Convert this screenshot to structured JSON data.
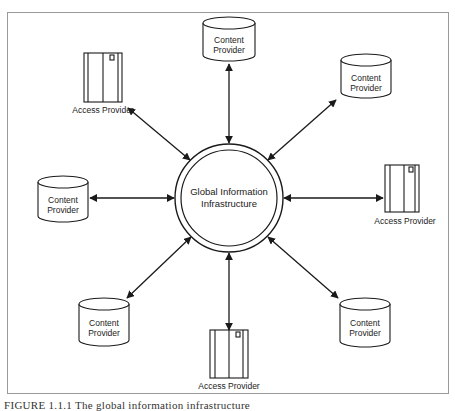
{
  "diagram": {
    "center": {
      "line1": "Global Information",
      "line2": "Infrastructure"
    },
    "nodes": [
      {
        "type": "content-provider",
        "position": "top",
        "line1": "Content",
        "line2": "Provider"
      },
      {
        "type": "access-provider",
        "position": "top-left",
        "label": "Access Provider"
      },
      {
        "type": "content-provider",
        "position": "top-right",
        "line1": "Content",
        "line2": "Provider"
      },
      {
        "type": "content-provider",
        "position": "left",
        "line1": "Content",
        "line2": "Provider"
      },
      {
        "type": "access-provider",
        "position": "right",
        "label": "Access Provider"
      },
      {
        "type": "content-provider",
        "position": "bottom-left",
        "line1": "Content",
        "line2": "Provider"
      },
      {
        "type": "access-provider",
        "position": "bottom",
        "label": "Access Provider"
      },
      {
        "type": "content-provider",
        "position": "bottom-right",
        "line1": "Content",
        "line2": "Provider"
      }
    ],
    "connections": "bidirectional arrows from each node to center",
    "colors": {
      "line": "#1a1a1a",
      "frame": "#999999",
      "background": "#ffffff"
    }
  },
  "caption": "FIGURE 1.1.1  The global information infrastructure"
}
